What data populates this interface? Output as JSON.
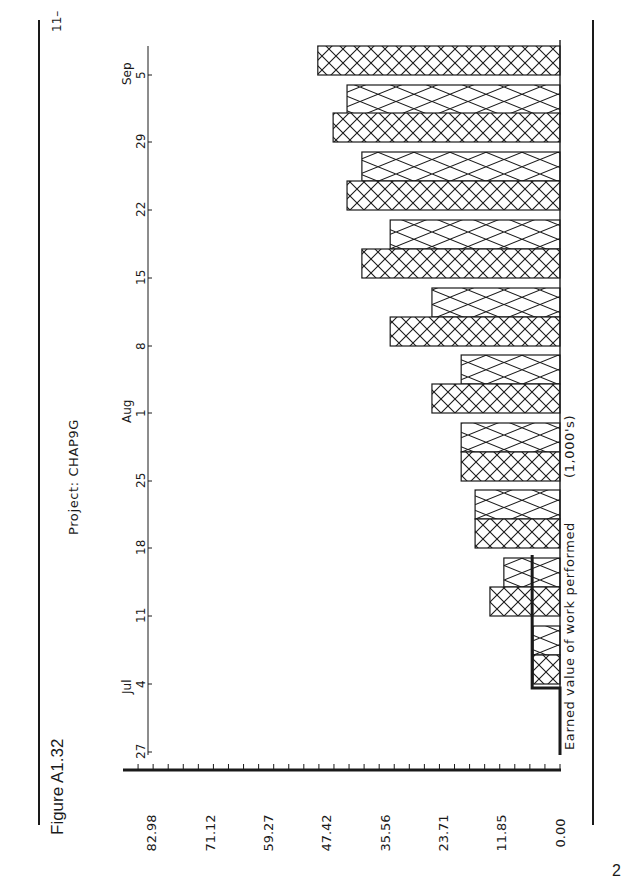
{
  "figure": {
    "title": "Figure A1.32",
    "page_number": "2"
  },
  "chart_data": {
    "type": "bar",
    "orientation": "horizontal (rotated 90° on page)",
    "title": "Project: CHAP9G",
    "units_label": "(1,000's)",
    "annotation": "Earned value of work performed",
    "value_axis": {
      "ticks": [
        "0.00",
        "11.85",
        "23.71",
        "35.56",
        "47.42",
        "59.27",
        "71.12",
        "82.98"
      ],
      "range": [
        0,
        82.98
      ],
      "minor_ticks": 28
    },
    "date_axis": {
      "ticks": [
        "27",
        "4",
        "11",
        "18",
        "25",
        "1",
        "8",
        "15",
        "22",
        "29",
        "5",
        "11"
      ],
      "month_labels": [
        {
          "label": "Jul",
          "at": "4"
        },
        {
          "label": "Aug",
          "at": "1"
        },
        {
          "label": "Sep",
          "at": "5"
        }
      ]
    },
    "categories": [
      "Jul 4",
      "Jul 11",
      "Jul 18",
      "Jul 25",
      "Aug 1",
      "Aug 8",
      "Aug 15",
      "Aug 22",
      "Aug 29",
      "Sep 5"
    ],
    "series": [
      {
        "name": "Cumulative (dense crosshatch)",
        "pattern": "dense",
        "values": [
          5.8,
          15.1,
          18.3,
          21.3,
          27.6,
          36.6,
          42.7,
          45.9,
          48.9,
          52.2
        ]
      },
      {
        "name": "Cumulative (light crosshatch)",
        "pattern": "light",
        "values": [
          5.8,
          12.1,
          18.3,
          21.3,
          21.3,
          27.6,
          36.6,
          42.7,
          45.9,
          null
        ]
      }
    ],
    "earned_value_line": {
      "value": 6.0,
      "from": "Jun 27",
      "to": "Jul 15"
    },
    "grid": false,
    "legend": "none"
  }
}
